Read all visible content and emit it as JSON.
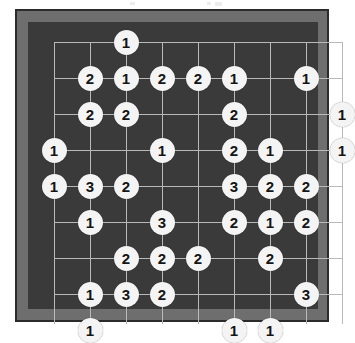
{
  "app": {
    "title": "Go Board Diagram",
    "board_name": "move-numbered-go-board"
  },
  "colors": {
    "page_background": "#ffffff",
    "board_frame": "#6e6e6e",
    "board_frame_border": "#2b2b2b",
    "board_surface": "#3a3a3a",
    "grid_line": "#b9b9b9",
    "stone_fill": "#f4f4f4",
    "stone_text": "#141414"
  },
  "board": {
    "size": 9,
    "columns": 9,
    "rows": 9,
    "grid_visible": true,
    "cell_size_px": 36,
    "field_left_px": 26,
    "field_top_px": 20,
    "stone_count": 45
  },
  "chart_data": {
    "type": "heatmap",
    "xlabel": "",
    "ylabel": "",
    "grid": true,
    "legend": "none",
    "x": [
      0,
      1,
      2,
      3,
      4,
      5,
      6,
      7,
      8
    ],
    "y": [
      0,
      1,
      2,
      3,
      4,
      5,
      6,
      7,
      8
    ],
    "stones": [
      {
        "col": 2,
        "row": 0,
        "label": "1"
      },
      {
        "col": 1,
        "row": 1,
        "label": "2"
      },
      {
        "col": 2,
        "row": 1,
        "label": "1"
      },
      {
        "col": 3,
        "row": 1,
        "label": "2"
      },
      {
        "col": 4,
        "row": 1,
        "label": "2"
      },
      {
        "col": 5,
        "row": 1,
        "label": "1"
      },
      {
        "col": 7,
        "row": 1,
        "label": "1"
      },
      {
        "col": 1,
        "row": 2,
        "label": "2"
      },
      {
        "col": 2,
        "row": 2,
        "label": "2"
      },
      {
        "col": 5,
        "row": 2,
        "label": "2"
      },
      {
        "col": 8,
        "row": 2,
        "label": "1"
      },
      {
        "col": 0,
        "row": 3,
        "label": "1"
      },
      {
        "col": 3,
        "row": 3,
        "label": "1"
      },
      {
        "col": 5,
        "row": 3,
        "label": "2"
      },
      {
        "col": 6,
        "row": 3,
        "label": "1"
      },
      {
        "col": 8,
        "row": 3,
        "label": "1"
      },
      {
        "col": 0,
        "row": 4,
        "label": "1"
      },
      {
        "col": 1,
        "row": 4,
        "label": "3"
      },
      {
        "col": 2,
        "row": 4,
        "label": "2"
      },
      {
        "col": 5,
        "row": 4,
        "label": "3"
      },
      {
        "col": 6,
        "row": 4,
        "label": "2"
      },
      {
        "col": 7,
        "row": 4,
        "label": "2"
      },
      {
        "col": 1,
        "row": 5,
        "label": "1"
      },
      {
        "col": 3,
        "row": 5,
        "label": "3"
      },
      {
        "col": 5,
        "row": 5,
        "label": "2"
      },
      {
        "col": 6,
        "row": 5,
        "label": "1"
      },
      {
        "col": 7,
        "row": 5,
        "label": "2"
      },
      {
        "col": 2,
        "row": 6,
        "label": "2"
      },
      {
        "col": 3,
        "row": 6,
        "label": "2"
      },
      {
        "col": 4,
        "row": 6,
        "label": "2"
      },
      {
        "col": 6,
        "row": 6,
        "label": "2"
      },
      {
        "col": 1,
        "row": 7,
        "label": "1"
      },
      {
        "col": 2,
        "row": 7,
        "label": "3"
      },
      {
        "col": 3,
        "row": 7,
        "label": "2"
      },
      {
        "col": 7,
        "row": 7,
        "label": "3"
      },
      {
        "col": 1,
        "row": 8,
        "label": "1"
      },
      {
        "col": 5,
        "row": 8,
        "label": "1"
      },
      {
        "col": 6,
        "row": 8,
        "label": "1"
      }
    ],
    "label_counts": {
      "1": 15,
      "2": 18,
      "3": 5
    }
  }
}
